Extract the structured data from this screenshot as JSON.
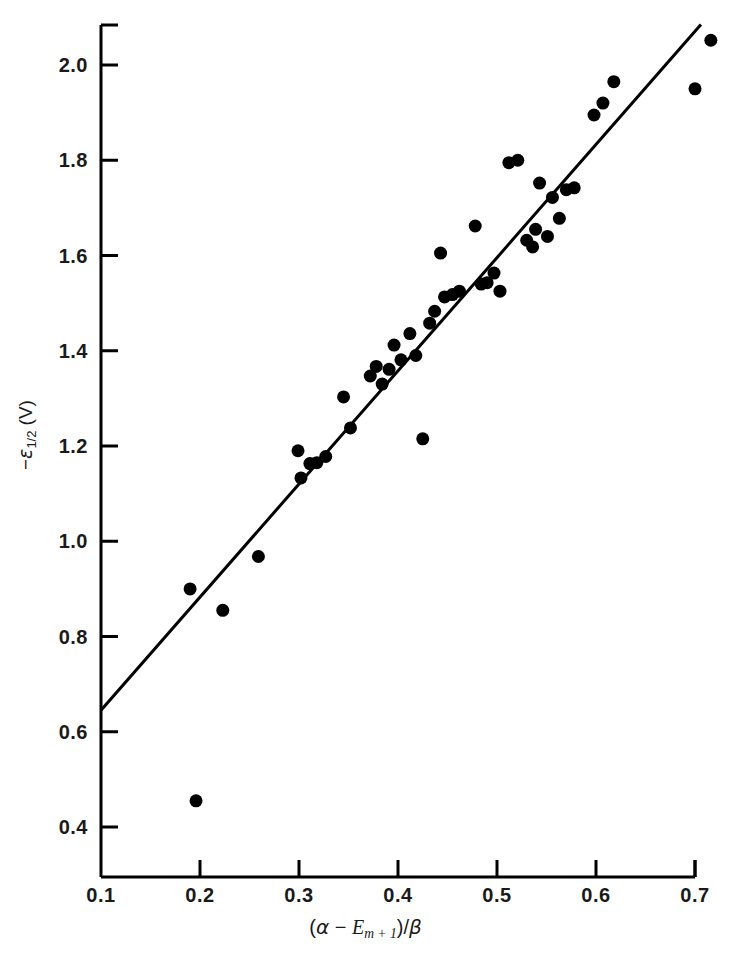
{
  "chart_data": {
    "type": "scatter",
    "title": "",
    "xlabel": "(α − E_{m + 1})/β",
    "ylabel": "−ε_{1/2} (V)",
    "xlim": [
      0.1,
      0.72
    ],
    "ylim": [
      0.33,
      2.1
    ],
    "xticks": [
      0.1,
      0.2,
      0.3,
      0.4,
      0.5,
      0.6,
      0.7
    ],
    "xtick_labels": [
      "0.1",
      "0.2",
      "0.3",
      "0.4",
      "0.5",
      "0.6",
      "0.7"
    ],
    "yticks": [
      0.4,
      0.6,
      0.8,
      1.0,
      1.2,
      1.4,
      1.6,
      1.8,
      2.0
    ],
    "ytick_labels": [
      "0.4",
      "0.6",
      "0.8",
      "1.0",
      "1.2",
      "1.4",
      "1.6",
      "1.8",
      "2.0"
    ],
    "grid": false,
    "legend": "none",
    "marker": {
      "shape": "circle",
      "color": "#000000",
      "size": 13
    },
    "fit_line": {
      "label": "least-squares fit",
      "color": "#000000",
      "width": 3,
      "x0": 0.1,
      "y0": 0.645,
      "x1": 0.706,
      "y1": 2.085
    },
    "points": [
      {
        "x": 0.19,
        "y": 0.9
      },
      {
        "x": 0.196,
        "y": 0.455
      },
      {
        "x": 0.223,
        "y": 0.855
      },
      {
        "x": 0.259,
        "y": 0.968
      },
      {
        "x": 0.299,
        "y": 1.19
      },
      {
        "x": 0.302,
        "y": 1.133
      },
      {
        "x": 0.311,
        "y": 1.163
      },
      {
        "x": 0.318,
        "y": 1.165
      },
      {
        "x": 0.327,
        "y": 1.178
      },
      {
        "x": 0.345,
        "y": 1.303
      },
      {
        "x": 0.352,
        "y": 1.238
      },
      {
        "x": 0.372,
        "y": 1.347
      },
      {
        "x": 0.378,
        "y": 1.367
      },
      {
        "x": 0.384,
        "y": 1.33
      },
      {
        "x": 0.391,
        "y": 1.361
      },
      {
        "x": 0.396,
        "y": 1.412
      },
      {
        "x": 0.403,
        "y": 1.381
      },
      {
        "x": 0.412,
        "y": 1.436
      },
      {
        "x": 0.418,
        "y": 1.39
      },
      {
        "x": 0.425,
        "y": 1.215
      },
      {
        "x": 0.432,
        "y": 1.458
      },
      {
        "x": 0.437,
        "y": 1.483
      },
      {
        "x": 0.443,
        "y": 1.605
      },
      {
        "x": 0.447,
        "y": 1.513
      },
      {
        "x": 0.455,
        "y": 1.518
      },
      {
        "x": 0.462,
        "y": 1.525
      },
      {
        "x": 0.478,
        "y": 1.662
      },
      {
        "x": 0.484,
        "y": 1.54
      },
      {
        "x": 0.49,
        "y": 1.543
      },
      {
        "x": 0.497,
        "y": 1.563
      },
      {
        "x": 0.503,
        "y": 1.525
      },
      {
        "x": 0.512,
        "y": 1.795
      },
      {
        "x": 0.521,
        "y": 1.8
      },
      {
        "x": 0.53,
        "y": 1.632
      },
      {
        "x": 0.536,
        "y": 1.618
      },
      {
        "x": 0.539,
        "y": 1.655
      },
      {
        "x": 0.543,
        "y": 1.752
      },
      {
        "x": 0.551,
        "y": 1.64
      },
      {
        "x": 0.556,
        "y": 1.722
      },
      {
        "x": 0.563,
        "y": 1.678
      },
      {
        "x": 0.57,
        "y": 1.738
      },
      {
        "x": 0.578,
        "y": 1.742
      },
      {
        "x": 0.598,
        "y": 1.895
      },
      {
        "x": 0.607,
        "y": 1.92
      },
      {
        "x": 0.618,
        "y": 1.965
      },
      {
        "x": 0.7,
        "y": 1.95
      },
      {
        "x": 0.716,
        "y": 2.052
      }
    ]
  },
  "axis_title": {
    "y_minus": "−",
    "y_epsilon": "ε",
    "y_sub": "1/2",
    "y_units": "(V)",
    "x_open": "(",
    "x_alpha": "α",
    "x_minus": "−",
    "x_E": "E",
    "x_Esub": "m + 1",
    "x_close": ")/",
    "x_beta": "β"
  }
}
